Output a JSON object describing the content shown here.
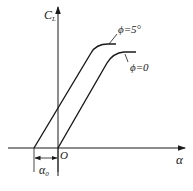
{
  "diagram": {
    "type": "lift-curve",
    "axes": {
      "y_label_main": "C",
      "y_label_sub": "L",
      "x_label": "α",
      "origin_label": "O"
    },
    "curves": [
      {
        "name": "phi-5",
        "label": "ϕ=5°",
        "zero_lift_x": 34
      },
      {
        "name": "phi-0",
        "label": "ϕ=0",
        "zero_lift_x": 58
      }
    ],
    "dimension": {
      "label_main": "α",
      "label_sub": "0"
    },
    "colors": {
      "line": "#1a1a1a",
      "background": "#ffffff"
    }
  }
}
